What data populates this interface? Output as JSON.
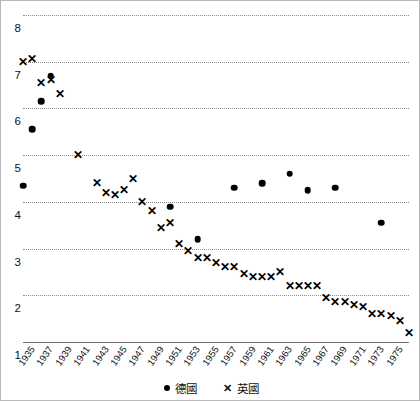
{
  "chart_data": {
    "type": "scatter",
    "title": "",
    "subtitle": "",
    "xlabel": "",
    "ylabel": "",
    "xlim": [
      1935,
      1975
    ],
    "ylim": [
      1,
      8
    ],
    "grid": true,
    "legend_position": "bottom-center",
    "y_ticks": [
      8,
      7,
      6,
      5,
      4,
      3,
      2,
      1
    ],
    "x_ticks": [
      "1935",
      "1937",
      "1939",
      "1941",
      "1943",
      "1945",
      "1947",
      "1949",
      "1951",
      "1953",
      "1955",
      "1957",
      "1959",
      "1961",
      "1963",
      "1965",
      "1967",
      "1969",
      "1971",
      "1973",
      "1975"
    ],
    "series": [
      {
        "name": "德國",
        "marker": "dot",
        "color": "#000000",
        "points": [
          {
            "x": 1935,
            "y": 4.35
          },
          {
            "x": 1938,
            "y": 6.7
          },
          {
            "x": 1937,
            "y": 6.15
          },
          {
            "x": 1936,
            "y": 5.55
          },
          {
            "x": 1951,
            "y": 3.9
          },
          {
            "x": 1954,
            "y": 3.2
          },
          {
            "x": 1958,
            "y": 4.3
          },
          {
            "x": 1961,
            "y": 4.4
          },
          {
            "x": 1964,
            "y": 4.6
          },
          {
            "x": 1966,
            "y": 4.25
          },
          {
            "x": 1969,
            "y": 4.3
          },
          {
            "x": 1974,
            "y": 3.55
          }
        ]
      },
      {
        "name": "英國",
        "marker": "cross",
        "color": "#000000",
        "points": [
          {
            "x": 1935,
            "y": 7.0
          },
          {
            "x": 1936,
            "y": 7.05
          },
          {
            "x": 1937,
            "y": 6.55
          },
          {
            "x": 1938,
            "y": 6.6
          },
          {
            "x": 1939,
            "y": 6.3
          },
          {
            "x": 1941,
            "y": 5.0
          },
          {
            "x": 1943,
            "y": 4.4
          },
          {
            "x": 1944,
            "y": 4.2
          },
          {
            "x": 1945,
            "y": 4.15
          },
          {
            "x": 1946,
            "y": 4.25
          },
          {
            "x": 1947,
            "y": 4.5
          },
          {
            "x": 1948,
            "y": 4.0
          },
          {
            "x": 1949,
            "y": 3.8
          },
          {
            "x": 1950,
            "y": 3.45
          },
          {
            "x": 1951,
            "y": 3.55
          },
          {
            "x": 1952,
            "y": 3.1
          },
          {
            "x": 1953,
            "y": 2.95
          },
          {
            "x": 1954,
            "y": 2.8
          },
          {
            "x": 1955,
            "y": 2.8
          },
          {
            "x": 1956,
            "y": 2.7
          },
          {
            "x": 1957,
            "y": 2.6
          },
          {
            "x": 1958,
            "y": 2.6
          },
          {
            "x": 1959,
            "y": 2.45
          },
          {
            "x": 1960,
            "y": 2.4
          },
          {
            "x": 1961,
            "y": 2.4
          },
          {
            "x": 1962,
            "y": 2.4
          },
          {
            "x": 1963,
            "y": 2.5
          },
          {
            "x": 1964,
            "y": 2.2
          },
          {
            "x": 1965,
            "y": 2.2
          },
          {
            "x": 1966,
            "y": 2.2
          },
          {
            "x": 1967,
            "y": 2.2
          },
          {
            "x": 1968,
            "y": 1.95
          },
          {
            "x": 1969,
            "y": 1.85
          },
          {
            "x": 1970,
            "y": 1.85
          },
          {
            "x": 1971,
            "y": 1.8
          },
          {
            "x": 1972,
            "y": 1.75
          },
          {
            "x": 1973,
            "y": 1.6
          },
          {
            "x": 1974,
            "y": 1.6
          },
          {
            "x": 1975,
            "y": 1.55
          },
          {
            "x": 1976,
            "y": 1.45
          },
          {
            "x": 1977,
            "y": 1.2
          }
        ]
      }
    ]
  },
  "legend": {
    "items": [
      {
        "marker": "●",
        "label": "德國"
      },
      {
        "marker": "✕",
        "label": "英國"
      }
    ]
  }
}
